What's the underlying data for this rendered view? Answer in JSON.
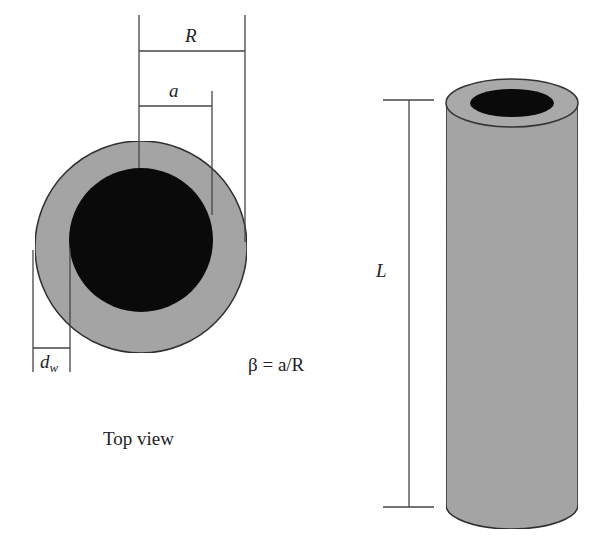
{
  "colors": {
    "background": "#ffffff",
    "wall": "#a9a9a9",
    "core": "#0a0a0a",
    "stroke": "#333333",
    "dimension_line": "#444444",
    "text": "#222222"
  },
  "top_view": {
    "caption": "Top view",
    "label_R": "R",
    "label_a": "a",
    "label_dw_main": "d",
    "label_dw_sub": "w",
    "formula": "β = a/R"
  },
  "side_view": {
    "label_L": "L"
  }
}
